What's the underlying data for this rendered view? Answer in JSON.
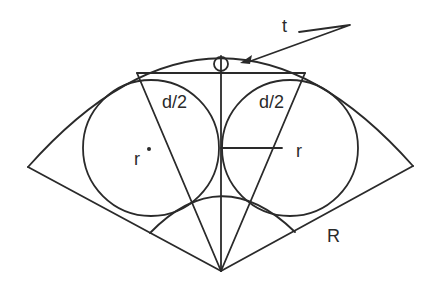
{
  "diagram": {
    "type": "geometry-figure",
    "labels": {
      "t": "t",
      "d_half_left": "d/2",
      "d_half_right": "d/2",
      "r_left": "r",
      "r_right": "r",
      "R": "R"
    },
    "colors": {
      "stroke": "#2a2a2a",
      "background": "#ffffff"
    }
  }
}
